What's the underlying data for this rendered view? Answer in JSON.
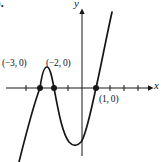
{
  "figure": {
    "item_label": "b.",
    "background": "#ffffff",
    "ink_color": "#161616",
    "axis_labels": {
      "x": "x",
      "y": "y"
    },
    "point_labels": [
      {
        "text": "(−3, 0)"
      },
      {
        "text": "(−2, 0)"
      },
      {
        "text": "(1, 0)"
      }
    ]
  },
  "chart_data": {
    "type": "line",
    "title": "",
    "xlabel": "x",
    "ylabel": "y",
    "grid": false,
    "legend": false,
    "xlim": [
      -5.4,
      4.9
    ],
    "x_ticks": [
      -4,
      -3,
      -2,
      -1,
      1,
      2,
      3,
      4
    ],
    "marked_points": [
      {
        "x": -3,
        "y": 0,
        "label": "(−3, 0)"
      },
      {
        "x": -2,
        "y": 0,
        "label": "(−2, 0)"
      },
      {
        "x": 1,
        "y": 0,
        "label": "(1, 0)"
      }
    ],
    "roots": [
      -3,
      -2,
      1
    ],
    "series": [
      {
        "name": "cubic-curve",
        "x": [
          -3.6,
          -3.3,
          -3,
          -2.75,
          -2.5,
          -2.25,
          -2,
          -1.5,
          -1,
          -0.5,
          -0.25,
          0,
          0.5,
          1,
          1.15,
          1.3
        ],
        "y": [
          -4.42,
          -1.68,
          0,
          0.7,
          0.88,
          0.61,
          0,
          -1.88,
          -4,
          -5.63,
          -6.02,
          -6,
          -4.38,
          0,
          1.96,
          4.26
        ]
      }
    ],
    "render": {
      "ink": "#161616",
      "x_axis": {
        "x1": 6,
        "y1": 88,
        "x2": 148,
        "y2": 88
      },
      "x_arrow": "148,85.3 153.5,88 148,90.7",
      "y_axis": {
        "x1": 82,
        "y1": 13,
        "x2": 82,
        "y2": 156
      },
      "y_arrow": "79.3,14 82,8.5 84.7,14",
      "tick_xs": [
        26,
        68,
        110,
        124,
        138
      ],
      "tick_half": 3,
      "dot_r": 3,
      "dots": [
        [
          40,
          88
        ],
        [
          54,
          88
        ],
        [
          96,
          88
        ]
      ],
      "curve_path": "M19,162 C25,138 33,106 40,88 C42,73 44,67 47,67 C50,67 52,77 54,88 C58,109 62,133 69,142 C73,146.5 77,146.5 81,142 C86,136 91,110 96,88 C100,71 106,39 112,12"
    }
  }
}
